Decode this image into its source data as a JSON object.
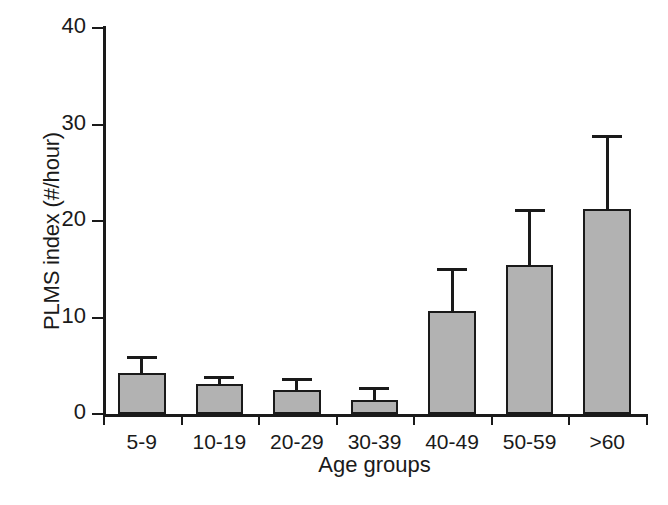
{
  "chart_data": {
    "type": "bar",
    "title": "",
    "xlabel": "Age groups",
    "ylabel": "PLMS index (#/hour)",
    "categories": [
      "5-9",
      "10-19",
      "20-29",
      "30-39",
      "40-49",
      "50-59",
      ">60"
    ],
    "values": [
      4.2,
      3.1,
      2.5,
      1.5,
      10.7,
      15.4,
      21.2
    ],
    "errors_upper": [
      1.8,
      0.8,
      1.2,
      1.3,
      4.4,
      5.8,
      7.7
    ],
    "error_bar_tops": [
      6.0,
      3.9,
      3.7,
      2.8,
      15.1,
      21.2,
      28.9
    ],
    "ylim": [
      0,
      40
    ],
    "yticks": [
      0,
      10,
      20,
      30,
      40
    ],
    "ytick_labels": [
      "0",
      "10",
      "20",
      "30",
      "40"
    ],
    "grid": false,
    "legend": false,
    "error_bar_direction": "upper-only",
    "bar_fill_color": "#b2b2b2",
    "bar_edge_color": "#1a1a1a",
    "axis_color": "#1a1a1a",
    "background_color": "#ffffff"
  },
  "caption_fragment": ""
}
